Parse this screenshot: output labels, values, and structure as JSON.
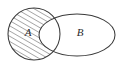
{
  "figure": {
    "type": "venn-diagram",
    "background_color": "#ffffff",
    "width": 123,
    "height": 68
  },
  "style": {
    "stroke_color": "#3a3a3a",
    "stroke_width": 1.05,
    "hatch_color": "#555555",
    "hatch_angle_deg": 60,
    "hatch_spacing_px": 4.5,
    "label_color": "#2b2b2b"
  },
  "sets": [
    {
      "id": "set-a",
      "label": "A",
      "shape": "circle",
      "cx": 34,
      "cy": 34,
      "r": 26,
      "label_x": 28,
      "label_y": 33,
      "fill": "hatched",
      "fill_description": "diagonal hatch lines"
    },
    {
      "id": "set-b",
      "label": "B",
      "shape": "ellipse",
      "cx": 77,
      "cy": 35,
      "rx": 38,
      "ry": 21,
      "label_x": 80,
      "label_y": 33,
      "fill": "none",
      "fill_description": "white / unfilled"
    }
  ],
  "shaded_region": {
    "id": "region-a-minus-b",
    "description": "A only (A minus B)",
    "notation": "A \\ B",
    "fill": "hatched"
  },
  "unshaded_regions": [
    {
      "id": "region-intersection",
      "description": "A intersect B",
      "notation": "A ∩ B",
      "fill": "white"
    },
    {
      "id": "region-b-minus-a",
      "description": "B only (B minus A)",
      "notation": "B \\ A",
      "fill": "white"
    }
  ]
}
